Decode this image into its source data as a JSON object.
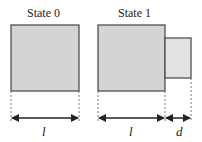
{
  "states": [
    {
      "title": "State 0"
    },
    {
      "title": "State 1"
    }
  ],
  "dimensions": {
    "state0_width": "l",
    "state1_width": "l",
    "state1_extra": "d"
  },
  "colors": {
    "box_fill": "#d4d4d4",
    "small_box_fill": "#e2e2e2",
    "stroke": "#444444"
  }
}
